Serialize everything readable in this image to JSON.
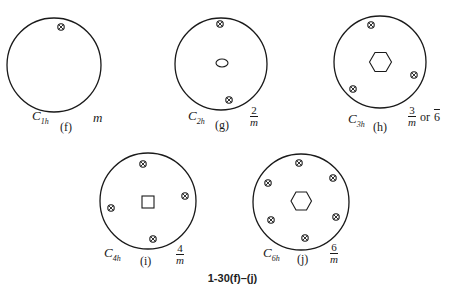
{
  "figure": {
    "caption": "1-30(f)–(j)",
    "symmetry_marker": "circle-with-x (⊗)",
    "diagrams": [
      {
        "id": "f",
        "letter": "(f)",
        "schoenflies": "C",
        "schoenflies_sub": "1h",
        "hermann_mauguin": "m",
        "center_element": "none",
        "marker_count": 1
      },
      {
        "id": "g",
        "letter": "(g)",
        "schoenflies": "C",
        "schoenflies_sub": "2h",
        "hermann_mauguin_num": "2",
        "hermann_mauguin_den": "m",
        "center_element": "ellipse (2-fold axis)",
        "marker_count": 2
      },
      {
        "id": "h",
        "letter": "(h)",
        "schoenflies": "C",
        "schoenflies_sub": "3h",
        "hermann_mauguin_num": "3",
        "hermann_mauguin_den": "m",
        "hermann_mauguin_alt_prefix": "or",
        "hermann_mauguin_alt": "6",
        "center_element": "hexagon (-6 axis)",
        "marker_count": 3
      },
      {
        "id": "i",
        "letter": "(i)",
        "schoenflies": "C",
        "schoenflies_sub": "4h",
        "hermann_mauguin_num": "4",
        "hermann_mauguin_den": "m",
        "center_element": "square (4-fold axis)",
        "marker_count": 4
      },
      {
        "id": "j",
        "letter": "(j)",
        "schoenflies": "C",
        "schoenflies_sub": "6h",
        "hermann_mauguin_num": "6",
        "hermann_mauguin_den": "m",
        "center_element": "hexagon (6-fold axis)",
        "marker_count": 6
      }
    ]
  }
}
